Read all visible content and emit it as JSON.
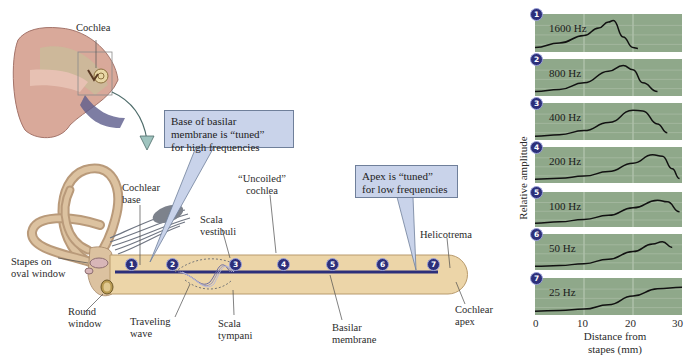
{
  "diagram": {
    "ear_label": "Cochlea",
    "callouts": {
      "base": [
        "Base of basilar",
        "membrane is “tuned”",
        "for high frequencies"
      ],
      "apex": [
        "Apex is “tuned”",
        "for low frequencies"
      ]
    },
    "labels": {
      "cochlear_base": [
        "Cochlear",
        "base"
      ],
      "uncoiled_cochlea": [
        "“Uncoiled”",
        "cochlea"
      ],
      "scala_vestibuli": [
        "Scala",
        "vestibuli"
      ],
      "helicotrema": "Helicotrema",
      "stapes": [
        "Stapes on",
        "oval window"
      ],
      "round_window": [
        "Round",
        "window"
      ],
      "traveling_wave": [
        "Traveling",
        "wave"
      ],
      "scala_tympani": [
        "Scala",
        "tympani"
      ],
      "basilar_membrane": [
        "Basilar",
        "membrane"
      ],
      "cochlear_apex": [
        "Cochlear",
        "apex"
      ]
    },
    "markers": [
      "1",
      "2",
      "3",
      "4",
      "5",
      "6",
      "7"
    ],
    "colors": {
      "callout_fill": "#c9d3ea",
      "tube_fill": "#ecd5a8",
      "membrane": "#2c2f7a",
      "panel_fill": "#8fa88a",
      "badge": "#2c2f7a",
      "arrow": "#7fa8a4"
    }
  },
  "chart_data": {
    "type": "line",
    "title": "",
    "xlabel": "Distance from stapes (mm)",
    "ylabel": "Relative amplitude",
    "xlim": [
      0,
      30
    ],
    "x_ticks": [
      "0",
      "10",
      "20",
      "30"
    ],
    "grid": true,
    "panels": [
      {
        "marker": "1",
        "label": "1600 Hz",
        "x": [
          0,
          5,
          10,
          13,
          15,
          16,
          18,
          20,
          21
        ],
        "y": [
          0.05,
          0.2,
          0.45,
          0.7,
          0.9,
          0.95,
          0.4,
          0.05,
          0.02
        ]
      },
      {
        "marker": "2",
        "label": "800 Hz",
        "x": [
          0,
          5,
          10,
          15,
          18,
          20,
          22,
          25
        ],
        "y": [
          0.05,
          0.12,
          0.35,
          0.75,
          0.95,
          0.8,
          0.35,
          0.05
        ]
      },
      {
        "marker": "3",
        "label": "400 Hz",
        "x": [
          0,
          5,
          10,
          15,
          20,
          22,
          25,
          27
        ],
        "y": [
          0.03,
          0.08,
          0.22,
          0.5,
          0.92,
          0.9,
          0.45,
          0.15
        ]
      },
      {
        "marker": "4",
        "label": "200 Hz",
        "x": [
          0,
          5,
          10,
          15,
          20,
          24,
          26,
          28,
          29.5
        ],
        "y": [
          0.03,
          0.06,
          0.14,
          0.3,
          0.6,
          0.9,
          0.85,
          0.4,
          0.05
        ]
      },
      {
        "marker": "5",
        "label": "100 Hz",
        "x": [
          0,
          5,
          10,
          15,
          20,
          25,
          27,
          29.5
        ],
        "y": [
          0.03,
          0.08,
          0.17,
          0.32,
          0.6,
          0.88,
          0.82,
          0.45
        ]
      },
      {
        "marker": "6",
        "label": "50 Hz",
        "x": [
          0,
          5,
          10,
          15,
          20,
          24,
          26,
          28
        ],
        "y": [
          0.03,
          0.05,
          0.12,
          0.28,
          0.55,
          0.82,
          0.9,
          0.7
        ]
      },
      {
        "marker": "7",
        "label": "25 Hz",
        "x": [
          0,
          5,
          10,
          15,
          20,
          25,
          30
        ],
        "y": [
          0.03,
          0.05,
          0.1,
          0.25,
          0.55,
          0.8,
          0.85
        ]
      }
    ]
  }
}
